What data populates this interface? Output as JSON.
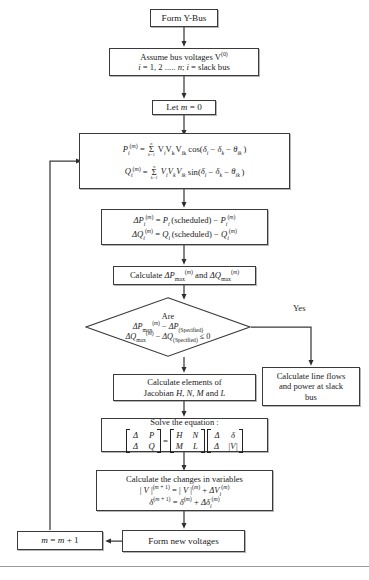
{
  "diagram": {
    "type": "flowchart",
    "nodes": [
      {
        "id": "form-y-bus",
        "shape": "process",
        "text": "Form Y-Bus"
      },
      {
        "id": "assume-bus-voltages",
        "shape": "process",
        "line1": "Assume bus voltages V(0)",
        "line2": "i = 1, 2 ..... n; i = slack bus"
      },
      {
        "id": "let-m-zero",
        "shape": "process",
        "text": "Let m = 0"
      },
      {
        "id": "power-equations",
        "shape": "process",
        "eq1": "Pi(m) = sum k=1..n Vi Vk Vik cos(di - dk - thetaik)",
        "eq2": "Qi(m) = sum k=1..n Vi Vk Vik sin(di - dk - thetaik)"
      },
      {
        "id": "mismatch-equations",
        "shape": "process",
        "eq1": "DPi(m) = Pi(scheduled) - Pi(m)",
        "eq2": "DQi(m) = Qi(scheduled) - Qi(m)",
        "scheduled_label": "(scheduled)"
      },
      {
        "id": "calculate-max-mismatch",
        "shape": "process",
        "text": "Calculate DPmax(m) and DQmax(m)",
        "prefix": "Calculate",
        "joiner": "and"
      },
      {
        "id": "convergence-decision",
        "shape": "decision",
        "line1": "Are",
        "line2": "DPmax(m) - DP(Specified)",
        "line3": "DQmax(m) - DQ(Specified) <= 0",
        "specified_label": "(Specified)"
      },
      {
        "id": "calculate-line-flows",
        "shape": "process",
        "line1": "Calculate line flows",
        "line2": "and power at slack",
        "line3": "bus"
      },
      {
        "id": "calculate-jacobian",
        "shape": "process",
        "line1": "Calculate elements of",
        "line2": "Jacobian H, N, M and L"
      },
      {
        "id": "solve-equation",
        "shape": "process",
        "heading": "Solve the equation :",
        "lhs": [
          "Δ P",
          "Δ Q"
        ],
        "jacobian": [
          [
            "H",
            "N"
          ],
          [
            "M",
            "L"
          ]
        ],
        "rhs": [
          "Δ δ",
          "Δ |V|"
        ]
      },
      {
        "id": "calculate-changes",
        "shape": "process",
        "line1": "Calculate the changes in variables",
        "line2": "|V|(m+1) = |V|(m) + DVi(m)",
        "line3": "delta(m+1) = delta(m) + Ddeltai(m)"
      },
      {
        "id": "form-new-voltages",
        "shape": "process",
        "text": "Form new voltages"
      },
      {
        "id": "increment-m",
        "shape": "process",
        "text": "m = m + 1"
      }
    ],
    "edge_labels": [
      {
        "id": "yes-branch-label",
        "text": "Yes"
      }
    ],
    "symbols": {
      "delta_cap": "Δ",
      "delta_low": "δ",
      "theta": "θ",
      "sigma": "Σ",
      "leq": "≤",
      "minus": "−",
      "sum_upper": "n",
      "sum_lower": "k=1"
    }
  }
}
